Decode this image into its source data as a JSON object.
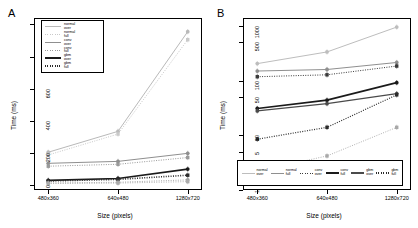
{
  "figure": {
    "panels": [
      {
        "id": "A",
        "label": "A"
      },
      {
        "id": "B",
        "label": "B"
      }
    ]
  },
  "chart_data": [
    {
      "type": "line",
      "panel": "A",
      "title": "A",
      "xlabel": "Size (pixels)",
      "ylabel": "Time (ms)",
      "scale": "linear",
      "categories": [
        "480x360",
        "640x480",
        "1280x720"
      ],
      "yticks": [
        0,
        200,
        400,
        600,
        800,
        1000
      ],
      "ylim": [
        -30,
        1040
      ],
      "grid": false,
      "legend_position": "top-left",
      "series": [
        {
          "name": "normal over",
          "values": [
            205,
            335,
            955
          ],
          "color": "#b9b9b9",
          "dash": "none",
          "marker": "circle",
          "width": 1.0
        },
        {
          "name": "normal full",
          "values": [
            188,
            318,
            905
          ],
          "color": "#c9c9c9",
          "dash": "dotted",
          "marker": "square",
          "width": 1.0
        },
        {
          "name": "conv over",
          "values": [
            136,
            148,
            198
          ],
          "color": "#8f8f8f",
          "dash": "none",
          "marker": "circle",
          "width": 1.0
        },
        {
          "name": "conv full",
          "values": [
            118,
            130,
            172
          ],
          "color": "#9a9a9a",
          "dash": "dotted",
          "marker": "square",
          "width": 1.0
        },
        {
          "name": "gbm over",
          "values": [
            30,
            42,
            100
          ],
          "color": "#1a1a1a",
          "dash": "none",
          "marker": "circle",
          "width": 1.6
        },
        {
          "name": "gbm full",
          "values": [
            26,
            36,
            62
          ],
          "color": "#2b2b2b",
          "dash": "dotted",
          "marker": "square",
          "width": 1.6
        }
      ],
      "extra_series": [
        {
          "name": "low a",
          "values": [
            14,
            18,
            33
          ],
          "color": "#9d9d9d",
          "dash": "dotted",
          "marker": "circle",
          "width": 0.9
        },
        {
          "name": "low b",
          "values": [
            10,
            13,
            22
          ],
          "color": "#ababab",
          "dash": "dotted",
          "marker": "square",
          "width": 0.9
        }
      ]
    },
    {
      "type": "line",
      "panel": "B",
      "title": "B",
      "xlabel": "Size (pixels)",
      "ylabel": "Time (ms)",
      "scale": "log",
      "categories": [
        "480x360",
        "640x480",
        "1280x720"
      ],
      "yticks": [
        1,
        5,
        10,
        50,
        100,
        500,
        1000
      ],
      "ylim": [
        1,
        1400
      ],
      "grid": false,
      "legend_position": "bottom-inside",
      "series": [
        {
          "name": "normal over",
          "values": [
            205,
            335,
            955
          ],
          "color": "#bdbdbd",
          "dash": "none",
          "marker": "circle",
          "width": 1.0
        },
        {
          "name": "normal full",
          "values": [
            150,
            160,
            215
          ],
          "color": "#8f8f8f",
          "dash": "none",
          "marker": "circle",
          "width": 1.0
        },
        {
          "name": "conv over",
          "values": [
            118,
            128,
            185
          ],
          "color": "#3a3a3a",
          "dash": "dotted",
          "marker": "square",
          "width": 1.0
        },
        {
          "name": "conv full",
          "values": [
            31,
            44,
            92
          ],
          "color": "#1a1a1a",
          "dash": "none",
          "marker": "circle",
          "width": 1.6
        },
        {
          "name": "gbm over",
          "values": [
            28,
            38,
            58
          ],
          "color": "#4a4a4a",
          "dash": "none",
          "marker": "circle",
          "width": 1.2
        },
        {
          "name": "gbm full",
          "values": [
            8.5,
            14,
            55
          ],
          "color": "#2b2b2b",
          "dash": "dotted",
          "marker": "square",
          "width": 1.2
        }
      ],
      "extra_series": [
        {
          "name": "low a",
          "values": [
            2.2,
            4.2,
            14
          ],
          "color": "#a8a8a8",
          "dash": "dotted",
          "marker": "square",
          "width": 0.9
        }
      ]
    }
  ],
  "legend_a": {
    "entries": [
      {
        "line1": "normal",
        "line2": "over"
      },
      {
        "line1": "normal",
        "line2": "full"
      },
      {
        "line1": "conv",
        "line2": "over"
      },
      {
        "line1": "conv",
        "line2": "full"
      },
      {
        "line1": "gbm",
        "line2": "over"
      },
      {
        "line1": "gbm",
        "line2": "full"
      }
    ]
  },
  "legend_b": {
    "entries": [
      {
        "line1": "normal",
        "line2": "over"
      },
      {
        "line1": "normal",
        "line2": "full"
      },
      {
        "line1": "conv",
        "line2": "over"
      },
      {
        "line1": "conv",
        "line2": "full"
      },
      {
        "line1": "gbm",
        "line2": "over"
      },
      {
        "line1": "gbm",
        "line2": "full"
      }
    ]
  }
}
